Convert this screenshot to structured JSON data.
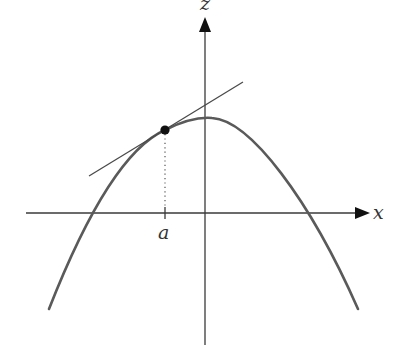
{
  "diagram": {
    "type": "tangent-line-to-concave-curve",
    "axes": {
      "x_label": "x",
      "z_label": "z"
    },
    "point": {
      "label": "a",
      "description": "point of tangency on curve"
    },
    "colors": {
      "curve": "#5a5a5a",
      "axes": "#3a3a3a",
      "tangent": "#4a4a4a",
      "point": "#111111",
      "background": "#ffffff"
    }
  }
}
